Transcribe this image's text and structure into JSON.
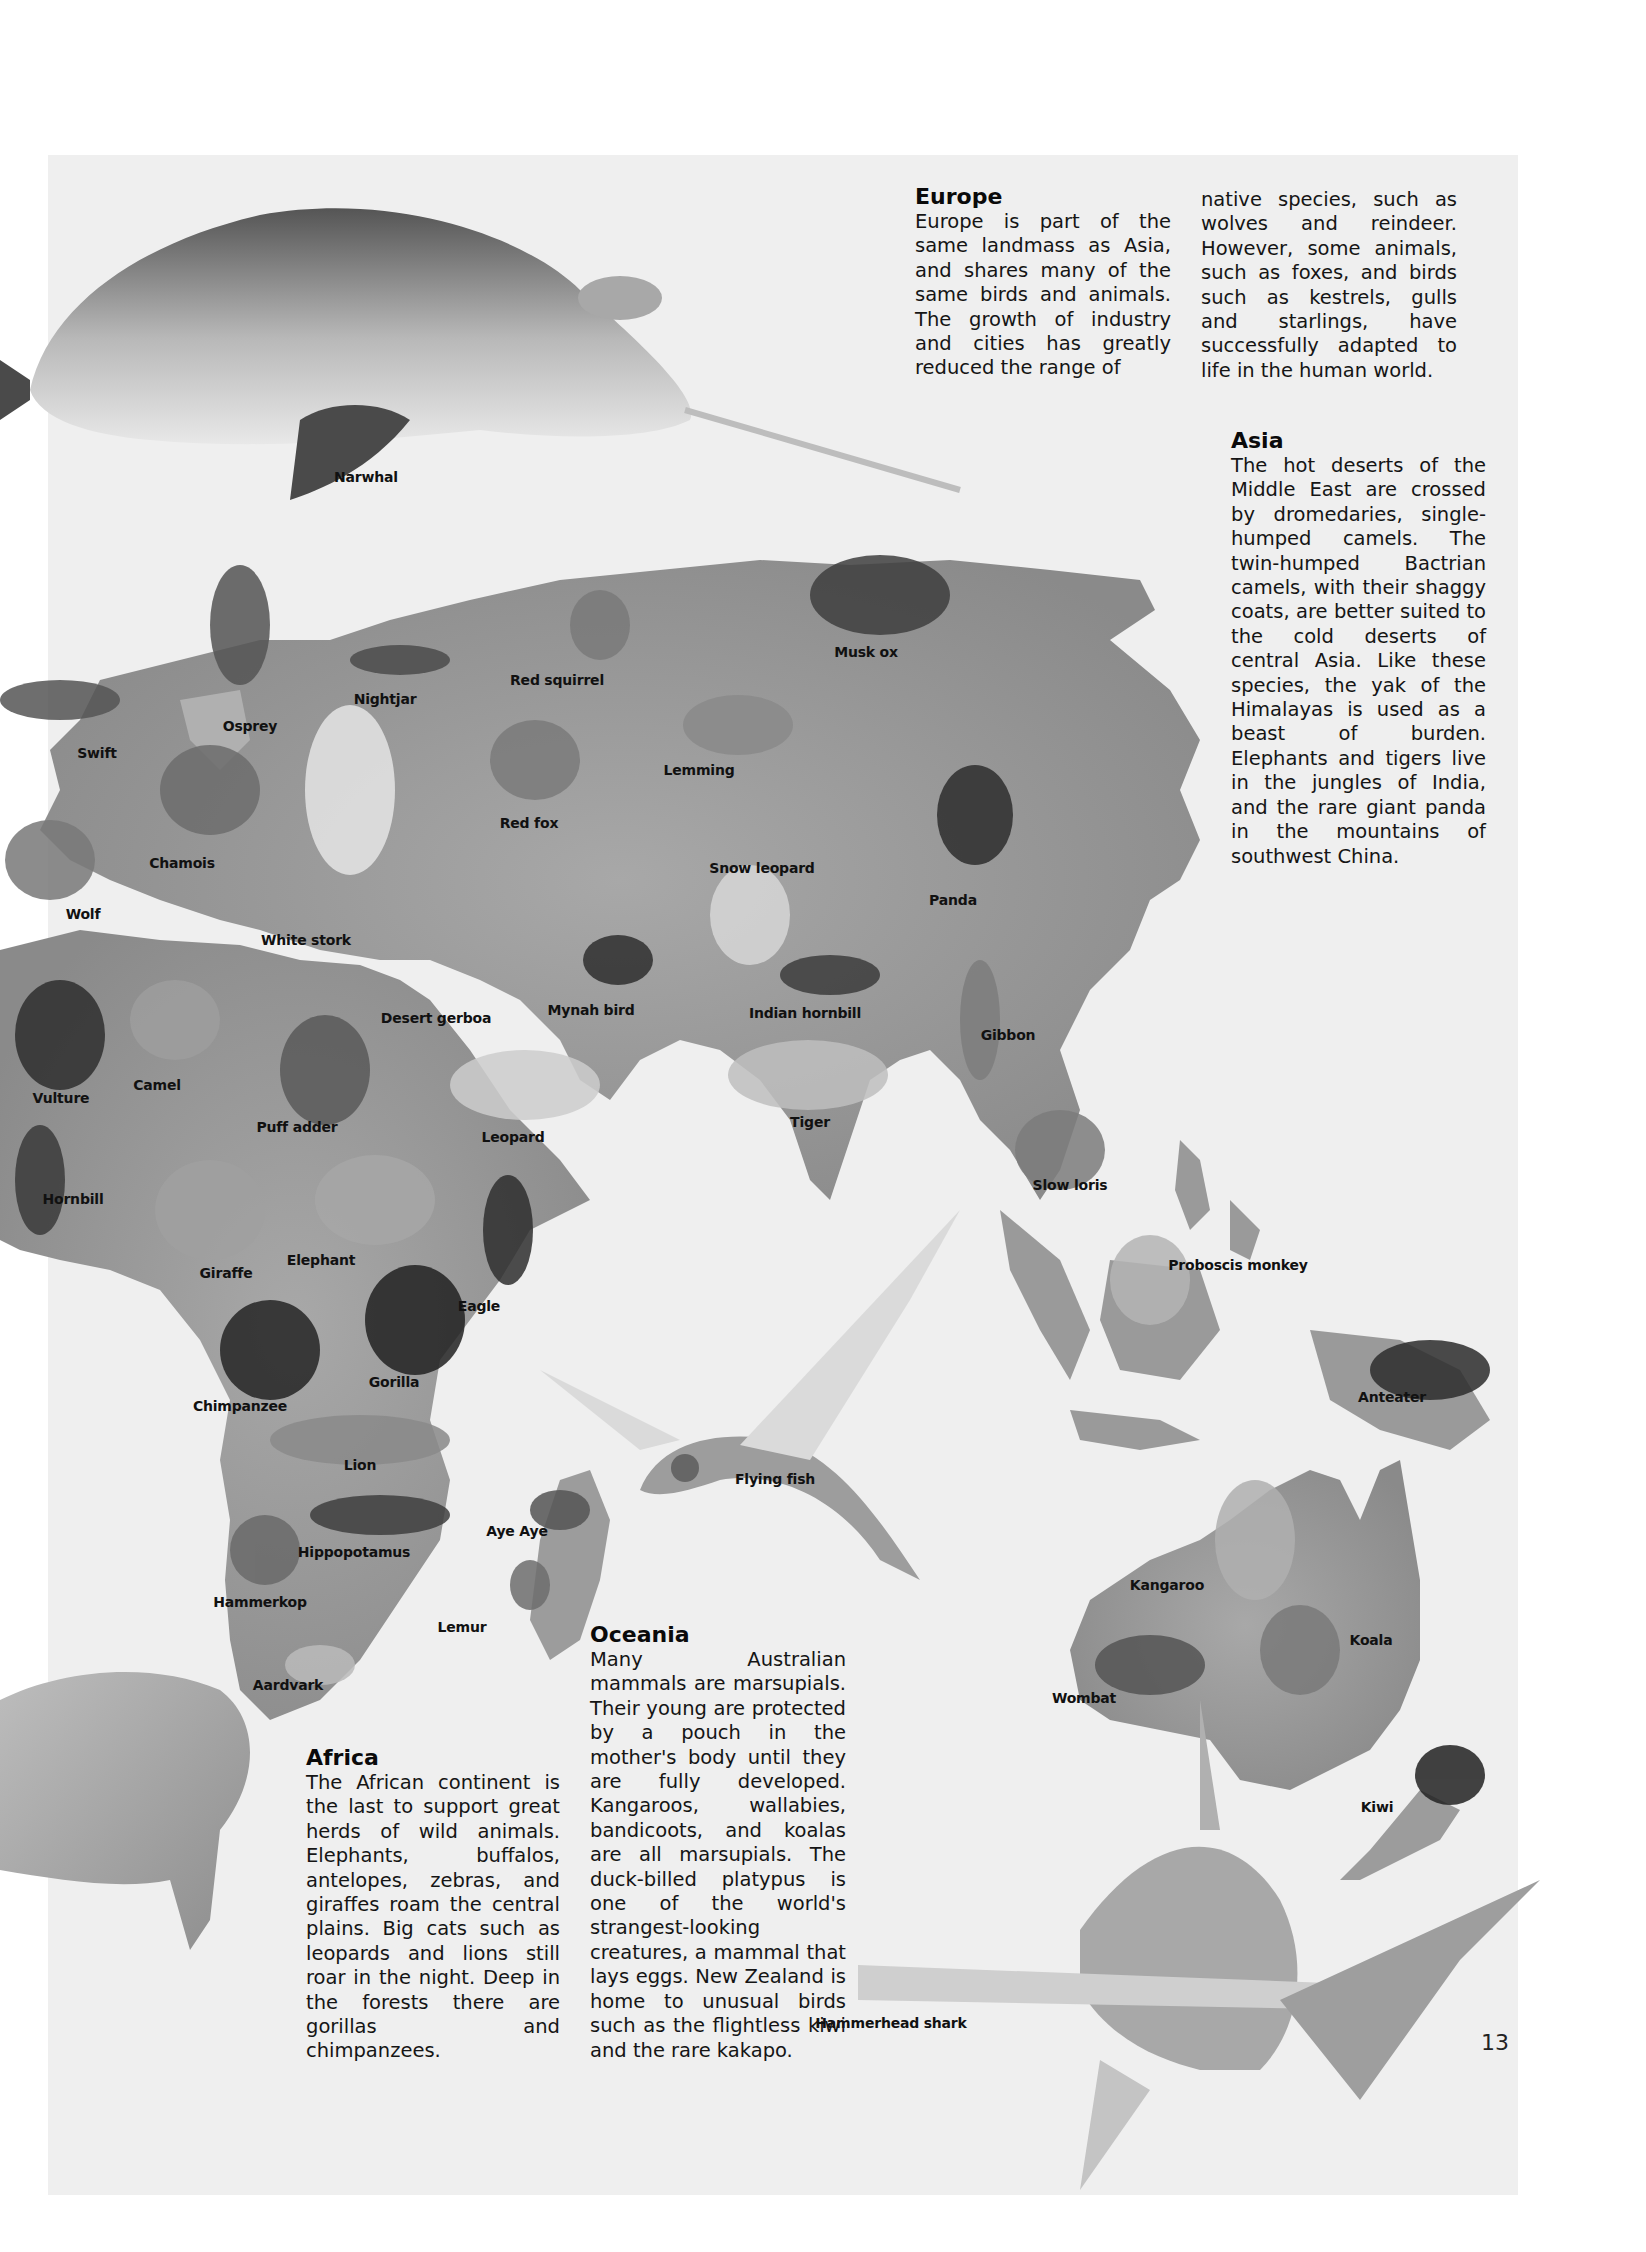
{
  "page": {
    "number": "13",
    "background": "#efefef",
    "land_color": "#9a9a9a",
    "ink_color": "#111111"
  },
  "sections": {
    "europe": {
      "title": "Europe",
      "col1": "Europe is part of the same landmass as Asia, and shares many of the same birds and animals. The growth of industry and cities has greatly reduced the range of",
      "col2": "native species, such as wolves and reindeer. However, some animals, such as foxes, and birds such as kestrels, gulls and starlings, have successfully adapted to life in the human world."
    },
    "asia": {
      "title": "Asia",
      "body": "The hot deserts of the Middle East are crossed by dromedaries, single-humped camels. The twin-humped Bactrian camels, with their shaggy coats, are better suited to the cold deserts of central Asia. Like these species, the yak of the Himalayas is used as a beast of burden. Elephants and tigers live in the jungles of India, and the rare giant panda in the mountains of southwest China."
    },
    "africa": {
      "title": "Africa",
      "body": "The African continent is the last to support great herds of wild animals. Elephants, buffalos, antelopes, zebras, and giraffes roam the central plains. Big cats such as leopards and lions still roar in the night. Deep in the forests there are gorillas and chimpanzees."
    },
    "oceania": {
      "title": "Oceania",
      "body": "Many Australian mammals are marsupials. Their young are protected by a pouch in the mother's body until they are fully developed. Kangaroos, wallabies, bandicoots, and koalas are all marsupials. The duck-billed platypus is one of the world's strangest-looking creatures, a mammal that lays eggs. New Zealand is home to unusual birds such as the flightless kiwi and the rare kakapo."
    }
  },
  "animal_labels": [
    {
      "name": "Narwhal",
      "x": 366,
      "y": 478
    },
    {
      "name": "Osprey",
      "x": 250,
      "y": 727
    },
    {
      "name": "Nightjar",
      "x": 385,
      "y": 700
    },
    {
      "name": "Red squirrel",
      "x": 557,
      "y": 681
    },
    {
      "name": "Musk ox",
      "x": 866,
      "y": 653
    },
    {
      "name": "Swift",
      "x": 97,
      "y": 754
    },
    {
      "name": "Lemming",
      "x": 699,
      "y": 771
    },
    {
      "name": "Chamois",
      "x": 182,
      "y": 864
    },
    {
      "name": "Red fox",
      "x": 529,
      "y": 824
    },
    {
      "name": "Snow leopard",
      "x": 762,
      "y": 869
    },
    {
      "name": "Panda",
      "x": 953,
      "y": 901
    },
    {
      "name": "Wolf",
      "x": 83,
      "y": 915
    },
    {
      "name": "White stork",
      "x": 306,
      "y": 941
    },
    {
      "name": "Desert gerboa",
      "x": 436,
      "y": 1019
    },
    {
      "name": "Mynah bird",
      "x": 591,
      "y": 1011
    },
    {
      "name": "Indian hornbill",
      "x": 805,
      "y": 1014
    },
    {
      "name": "Gibbon",
      "x": 1008,
      "y": 1036
    },
    {
      "name": "Camel",
      "x": 157,
      "y": 1086
    },
    {
      "name": "Vulture",
      "x": 61,
      "y": 1099
    },
    {
      "name": "Puff adder",
      "x": 297,
      "y": 1128
    },
    {
      "name": "Tiger",
      "x": 810,
      "y": 1123
    },
    {
      "name": "Leopard",
      "x": 513,
      "y": 1138
    },
    {
      "name": "Hornbill",
      "x": 73,
      "y": 1200
    },
    {
      "name": "Slow loris",
      "x": 1070,
      "y": 1186
    },
    {
      "name": "Elephant",
      "x": 321,
      "y": 1261
    },
    {
      "name": "Giraffe",
      "x": 226,
      "y": 1274
    },
    {
      "name": "Proboscis monkey",
      "x": 1238,
      "y": 1266
    },
    {
      "name": "Eagle",
      "x": 479,
      "y": 1307
    },
    {
      "name": "Gorilla",
      "x": 394,
      "y": 1383
    },
    {
      "name": "Chimpanzee",
      "x": 240,
      "y": 1407
    },
    {
      "name": "Anteater",
      "x": 1392,
      "y": 1398
    },
    {
      "name": "Lion",
      "x": 360,
      "y": 1466
    },
    {
      "name": "Flying fish",
      "x": 775,
      "y": 1480
    },
    {
      "name": "Aye Aye",
      "x": 517,
      "y": 1532
    },
    {
      "name": "Hippopotamus",
      "x": 354,
      "y": 1553
    },
    {
      "name": "Kangaroo",
      "x": 1167,
      "y": 1586
    },
    {
      "name": "Hammerkop",
      "x": 260,
      "y": 1603
    },
    {
      "name": "Lemur",
      "x": 462,
      "y": 1628
    },
    {
      "name": "Koala",
      "x": 1371,
      "y": 1641
    },
    {
      "name": "Aardvark",
      "x": 288,
      "y": 1686
    },
    {
      "name": "Wombat",
      "x": 1084,
      "y": 1699
    },
    {
      "name": "Kiwi",
      "x": 1377,
      "y": 1808
    },
    {
      "name": "Hammerhead shark",
      "x": 891,
      "y": 2024
    }
  ]
}
